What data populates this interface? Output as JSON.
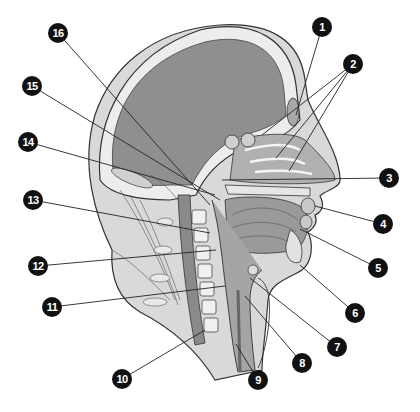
{
  "diagram": {
    "colors": {
      "background": "#ffffff",
      "brain": "#8f8f8f",
      "skull": "#e8e8e8",
      "soft_tissue": "#bdbdbd",
      "outline": "#333333",
      "callout_fill": "#111111",
      "callout_text": "#ffffff",
      "spine": "#8a8a8a"
    },
    "callouts": [
      {
        "label": "1",
        "x": 322,
        "y": 27,
        "targets": [
          [
            296,
            115
          ]
        ]
      },
      {
        "label": "2",
        "x": 353,
        "y": 64,
        "targets": [
          [
            262,
            135
          ],
          [
            276,
            158
          ],
          [
            289,
            171
          ]
        ]
      },
      {
        "label": "3",
        "x": 389,
        "y": 178,
        "targets": [
          [
            222,
            180
          ]
        ]
      },
      {
        "label": "4",
        "x": 383,
        "y": 224,
        "targets": [
          [
            315,
            206
          ]
        ]
      },
      {
        "label": "5",
        "x": 378,
        "y": 268,
        "targets": [
          [
            300,
            229
          ]
        ]
      },
      {
        "label": "6",
        "x": 355,
        "y": 313,
        "targets": [
          [
            300,
            265
          ]
        ]
      },
      {
        "label": "7",
        "x": 337,
        "y": 347,
        "targets": [
          [
            250,
            278
          ]
        ]
      },
      {
        "label": "8",
        "x": 302,
        "y": 363,
        "targets": [
          [
            245,
            296
          ]
        ]
      },
      {
        "label": "9",
        "x": 258,
        "y": 380,
        "targets": [
          [
            236,
            344
          ]
        ]
      },
      {
        "label": "10",
        "x": 122,
        "y": 379,
        "targets": [
          [
            205,
            330
          ]
        ]
      },
      {
        "label": "11",
        "x": 52,
        "y": 307,
        "targets": [
          [
            225,
            286
          ]
        ]
      },
      {
        "label": "12",
        "x": 38,
        "y": 266,
        "targets": [
          [
            216,
            250
          ]
        ]
      },
      {
        "label": "13",
        "x": 33,
        "y": 200,
        "targets": [
          [
            210,
            233
          ]
        ]
      },
      {
        "label": "14",
        "x": 28,
        "y": 142,
        "targets": [
          [
            215,
            195
          ]
        ]
      },
      {
        "label": "15",
        "x": 32,
        "y": 86,
        "targets": [
          [
            220,
            200
          ]
        ]
      },
      {
        "label": "16",
        "x": 58,
        "y": 33,
        "targets": [
          [
            210,
            205
          ]
        ]
      }
    ]
  }
}
